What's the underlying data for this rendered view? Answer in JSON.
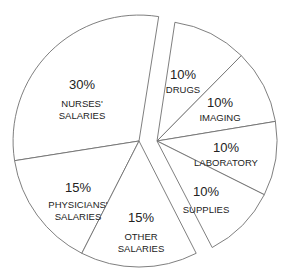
{
  "chart_data": {
    "type": "pie",
    "title": "",
    "exploded": true,
    "slices": [
      {
        "label": "NURSES' SALARIES",
        "label_lines": [
          "NURSES'",
          "SALARIES"
        ],
        "value": 30,
        "value_label": "30%"
      },
      {
        "label": "PHYSICIANS' SALARIES",
        "label_lines": [
          "PHYSICIANS'",
          "SALARIES"
        ],
        "value": 15,
        "value_label": "15%"
      },
      {
        "label": "OTHER SALARIES",
        "label_lines": [
          "OTHER",
          "SALARIES"
        ],
        "value": 15,
        "value_label": "15%"
      },
      {
        "label": "DRUGS",
        "label_lines": [
          "DRUGS"
        ],
        "value": 10,
        "value_label": "10%"
      },
      {
        "label": "IMAGING",
        "label_lines": [
          "IMAGING"
        ],
        "value": 10,
        "value_label": "10%"
      },
      {
        "label": "LABORATORY",
        "label_lines": [
          "LABORATORY"
        ],
        "value": 10,
        "value_label": "10%"
      },
      {
        "label": "SUPPLIES",
        "label_lines": [
          "SUPPLIES"
        ],
        "value": 10,
        "value_label": "10%"
      }
    ],
    "groups": [
      {
        "name": "Salaries",
        "slices": [
          "NURSES' SALARIES",
          "PHYSICIANS' SALARIES",
          "OTHER SALARIES"
        ],
        "total": 60
      },
      {
        "name": "Non-salary",
        "slices": [
          "DRUGS",
          "IMAGING",
          "LABORATORY",
          "SUPPLIES"
        ],
        "total": 40
      }
    ],
    "legend": "none",
    "colors": {
      "fill": "#ffffff",
      "stroke": "#707070",
      "text": "#222222"
    }
  }
}
